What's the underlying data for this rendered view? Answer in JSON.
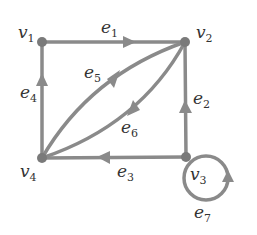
{
  "graph": {
    "colors": {
      "edge": "#8a8a8a",
      "vertex": "#7a7a7a",
      "text": "#333333"
    },
    "vertices": [
      {
        "id": "v1",
        "base": "v",
        "sub": "1"
      },
      {
        "id": "v2",
        "base": "v",
        "sub": "2"
      },
      {
        "id": "v3",
        "base": "v",
        "sub": "3"
      },
      {
        "id": "v4",
        "base": "v",
        "sub": "4"
      }
    ],
    "edges": [
      {
        "id": "e1",
        "base": "e",
        "sub": "1",
        "from": "v1",
        "to": "v2"
      },
      {
        "id": "e2",
        "base": "e",
        "sub": "2",
        "from": "v3",
        "to": "v2"
      },
      {
        "id": "e3",
        "base": "e",
        "sub": "3",
        "from": "v3",
        "to": "v4"
      },
      {
        "id": "e4",
        "base": "e",
        "sub": "4",
        "from": "v4",
        "to": "v1"
      },
      {
        "id": "e5",
        "base": "e",
        "sub": "5",
        "from": "v2",
        "to": "v4"
      },
      {
        "id": "e6",
        "base": "e",
        "sub": "6",
        "from": "v4",
        "to": "v2"
      },
      {
        "id": "e7",
        "base": "e",
        "sub": "7",
        "from": "v3",
        "to": "v3"
      }
    ]
  }
}
